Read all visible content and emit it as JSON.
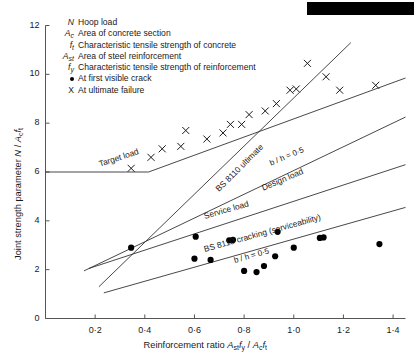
{
  "figure": {
    "redaction_bar": {
      "present": true,
      "x": 307,
      "y": 2,
      "width": 107,
      "height": 13,
      "color": "#000000"
    }
  },
  "chart_data": {
    "type": "scatter",
    "title": "",
    "xlabel": "Reinforcement ratio Ast fy / Ac ft",
    "ylabel": "Joint strength parameter N / Ac ft",
    "xlim": [
      0,
      1.45
    ],
    "ylim": [
      0,
      12
    ],
    "xticks": [
      0.2,
      0.4,
      0.6,
      0.8,
      1.0,
      1.2,
      1.4
    ],
    "xtick_labels": [
      "0·2",
      "0·4",
      "0·6",
      "0·8",
      "1·0",
      "1·2",
      "1·4"
    ],
    "yticks": [
      0,
      2,
      4,
      6,
      8,
      10,
      12
    ],
    "ytick_labels": [
      "0",
      "2",
      "4",
      "6",
      "8",
      "10",
      "12"
    ],
    "grid": false,
    "legend_position": "upper-left-inside",
    "series": [
      {
        "name": "At ultimate failure",
        "marker": "x",
        "color": "#1a1a1a",
        "points": [
          [
            0.345,
            6.15
          ],
          [
            0.425,
            6.6
          ],
          [
            0.47,
            6.95
          ],
          [
            0.545,
            7.05
          ],
          [
            0.565,
            7.7
          ],
          [
            0.65,
            7.35
          ],
          [
            0.715,
            7.6
          ],
          [
            0.745,
            7.95
          ],
          [
            0.79,
            7.95
          ],
          [
            0.82,
            8.35
          ],
          [
            0.885,
            8.5
          ],
          [
            0.93,
            8.8
          ],
          [
            0.985,
            9.35
          ],
          [
            1.01,
            9.4
          ],
          [
            1.055,
            10.45
          ],
          [
            1.13,
            9.9
          ],
          [
            1.185,
            9.35
          ],
          [
            1.33,
            9.55
          ]
        ]
      },
      {
        "name": "At first visible crack",
        "marker": "dot",
        "color": "#000000",
        "points": [
          [
            0.345,
            2.9
          ],
          [
            0.6,
            2.45
          ],
          [
            0.605,
            3.35
          ],
          [
            0.665,
            2.4
          ],
          [
            0.74,
            3.2
          ],
          [
            0.755,
            3.22
          ],
          [
            0.8,
            1.95
          ],
          [
            0.85,
            1.9
          ],
          [
            0.88,
            2.15
          ],
          [
            0.925,
            2.55
          ],
          [
            0.935,
            3.55
          ],
          [
            1.0,
            2.9
          ],
          [
            1.105,
            3.3
          ],
          [
            1.12,
            3.32
          ],
          [
            1.345,
            3.05
          ]
        ]
      }
    ],
    "lines": [
      {
        "name": "Target load",
        "label": "Target load",
        "points": [
          [
            0.0,
            6.0
          ],
          [
            0.415,
            6.0
          ],
          [
            1.45,
            9.85
          ]
        ],
        "label_x": 0.215,
        "label_y": 6.52,
        "label_rotation": -18.5
      },
      {
        "name": "BS 8110 ultimate",
        "label": "BS 8110 ultimate",
        "points": [
          [
            0.215,
            1.3
          ],
          [
            1.23,
            11.3
          ]
        ],
        "label_x": 0.69,
        "label_y": 5.45,
        "label_rotation": -45.0
      },
      {
        "name": "Design load",
        "label": "Design load",
        "points": [
          [
            0.155,
            1.95
          ],
          [
            1.45,
            8.25
          ]
        ],
        "label_x": 0.87,
        "label_y": 5.55,
        "label_rotation": -23.0
      },
      {
        "name": "Service load",
        "label": "Service load",
        "points": [
          [
            0.175,
            2.05
          ],
          [
            1.45,
            6.3
          ]
        ],
        "label_x": 0.64,
        "label_y": 4.4,
        "label_rotation": -16.0
      },
      {
        "name": "BS 8110 cracking (serviceability)",
        "label": "BS 8110 cracking (serviceability)",
        "points": [
          [
            0.235,
            1.05
          ],
          [
            1.45,
            4.55
          ]
        ],
        "label_x": 0.64,
        "label_y": 3.05,
        "label_rotation": -15.5
      }
    ],
    "annotations": [
      {
        "name": "bh-ratio-upper",
        "text": "b / h = 0·5",
        "x": 0.905,
        "y": 6.55,
        "rotation": -23.0
      },
      {
        "name": "bh-ratio-lower",
        "text": "b / h = 0·5",
        "x": 0.76,
        "y": 2.55,
        "rotation": -15.5
      }
    ]
  },
  "legend": {
    "entries": [
      {
        "symbol": "N",
        "sub": "",
        "text": "Hoop load",
        "upright": false
      },
      {
        "symbol": "A",
        "sub": "c",
        "text": "Area of concrete section",
        "upright": false
      },
      {
        "symbol": "f",
        "sub": "t",
        "text": "Characteristic tensile strength of concrete",
        "upright": false
      },
      {
        "symbol": "A",
        "sub": "st",
        "text": "Area of steel reinforcement",
        "upright": false
      },
      {
        "symbol": "f",
        "sub": "y",
        "text": "Characteristic tensile strength of reinforcement",
        "upright": false
      },
      {
        "symbol": "●",
        "sub": "",
        "text": "At first visible crack",
        "upright": true
      },
      {
        "symbol": "X",
        "sub": "",
        "text": "At ultimate failure",
        "upright": true
      }
    ]
  }
}
